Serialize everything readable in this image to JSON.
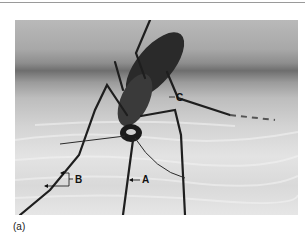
{
  "figure": {
    "caption": "(a)",
    "labels": {
      "A": "A",
      "B": "B",
      "C": "C"
    }
  }
}
